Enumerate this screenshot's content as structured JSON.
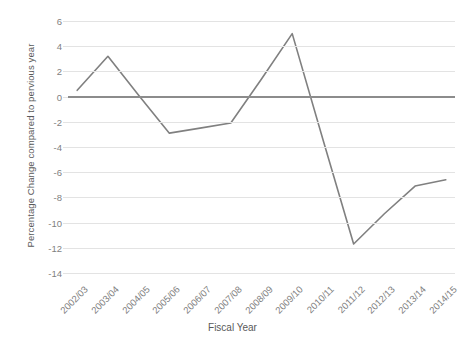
{
  "chart_data": {
    "type": "line",
    "title": "",
    "xlabel": "Fiscal Year",
    "ylabel": "Percentage Change compared to pervious year",
    "categories": [
      "2002/03",
      "2003/04",
      "2004/05",
      "2005/06",
      "2006/07",
      "2007/08",
      "2008/09",
      "2009/10",
      "2010/11",
      "2011/12",
      "2012/13",
      "2013/14",
      "2014/15"
    ],
    "values": [
      0.5,
      3.2,
      0.1,
      -2.9,
      -2.5,
      -2.1,
      1.4,
      5.0,
      -3.4,
      -11.7,
      -9.3,
      -7.1,
      -6.6
    ],
    "series": [
      {
        "name": "Percentage change",
        "values": [
          0.5,
          3.2,
          0.1,
          -2.9,
          -2.5,
          -2.1,
          1.4,
          5.0,
          -3.4,
          -11.7,
          -9.3,
          -7.1,
          -6.6
        ]
      }
    ],
    "ylim": [
      -14,
      6
    ],
    "yticks": [
      6,
      4,
      2,
      0,
      -2,
      -4,
      -6,
      -8,
      -10,
      -12,
      -14
    ],
    "ytick_labels": [
      "6",
      "4",
      "2",
      "0",
      "-2",
      "-4",
      "-6",
      "-8",
      "-10",
      "-12",
      "-14"
    ],
    "grid": true,
    "legend": false,
    "legend_position": "none",
    "line_color": "#808080",
    "gridline_color": "#E3E3E3",
    "zeroline_color": "#8C8C8C",
    "background_color": "#FFFFFF",
    "text_color": "#7F7F7F",
    "markers": false,
    "xtick_rotation": -45
  }
}
